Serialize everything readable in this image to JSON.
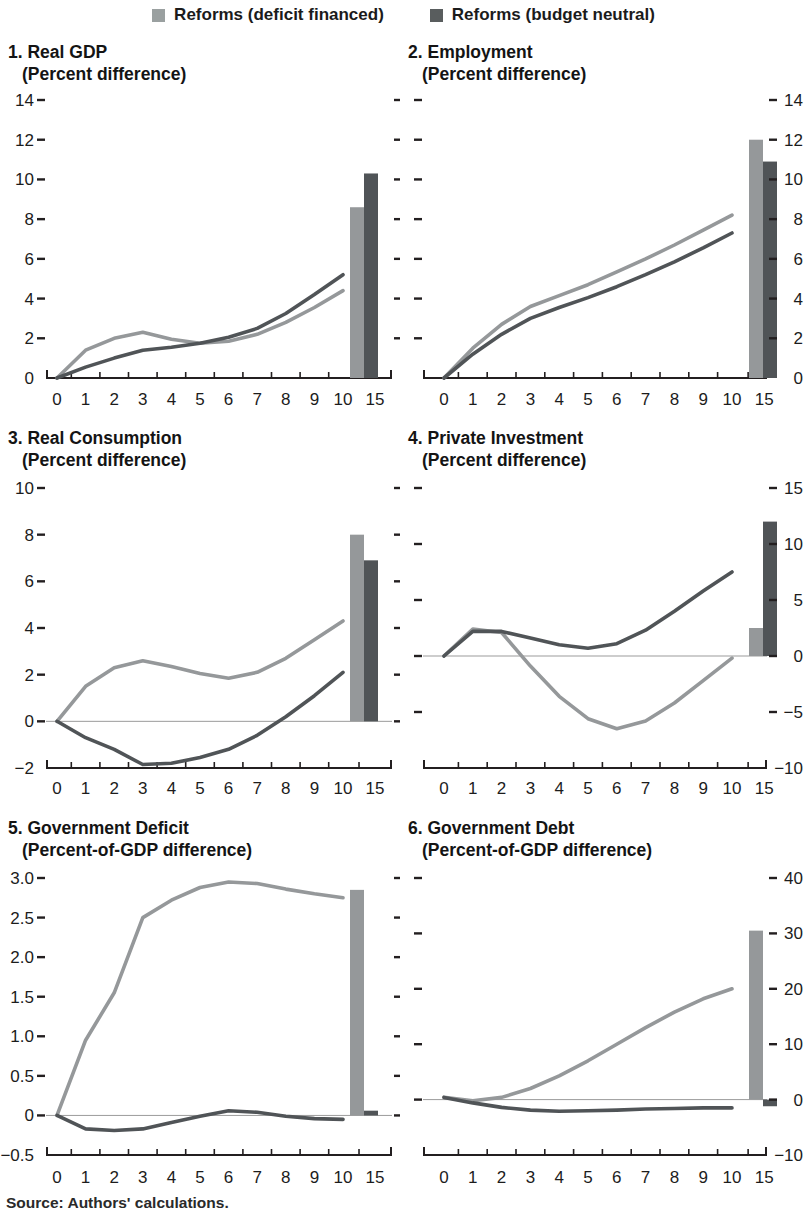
{
  "legend": {
    "items": [
      {
        "label": "Reforms (deficit financed)",
        "color": "#9aa0a0"
      },
      {
        "label": "Reforms (budget neutral)",
        "color": "#595d5e"
      }
    ]
  },
  "source_note": "Source: Authors' calculations.",
  "colors": {
    "series_light": "#95989a",
    "series_dark": "#505457",
    "axis": "#231f20",
    "tick_label": "#1c1c1c",
    "zero_line": "#9b9b9b",
    "background": "#ffffff"
  },
  "chart_data": [
    {
      "type": "line+bar",
      "title": "1. Real GDP",
      "subtitle": "(Percent difference)",
      "x": [
        0,
        1,
        2,
        3,
        4,
        5,
        6,
        7,
        8,
        9,
        10
      ],
      "x_tick_labels": [
        "0",
        "1",
        "2",
        "3",
        "4",
        "5",
        "6",
        "7",
        "8",
        "9",
        "10",
        "15"
      ],
      "bar_x_label": "15",
      "ylim": [
        0,
        14
      ],
      "yticks": [
        0,
        2,
        4,
        6,
        8,
        10,
        12,
        14
      ],
      "ytick_labels": [
        "0",
        "2",
        "4",
        "6",
        "8",
        "10",
        "12",
        "14"
      ],
      "ylabel_side": "left",
      "zero_line": false,
      "series": [
        {
          "name": "Reforms (deficit financed)",
          "values": [
            0,
            1.4,
            2.0,
            2.3,
            1.95,
            1.75,
            1.85,
            2.2,
            2.8,
            3.55,
            4.4
          ],
          "value_year15": 8.6
        },
        {
          "name": "Reforms (budget neutral)",
          "values": [
            0,
            0.55,
            1.0,
            1.4,
            1.55,
            1.75,
            2.05,
            2.5,
            3.25,
            4.2,
            5.2
          ],
          "value_year15": 10.3
        }
      ]
    },
    {
      "type": "line+bar",
      "title": "2. Employment",
      "subtitle": "(Percent difference)",
      "x": [
        0,
        1,
        2,
        3,
        4,
        5,
        6,
        7,
        8,
        9,
        10
      ],
      "x_tick_labels": [
        "0",
        "1",
        "2",
        "3",
        "4",
        "5",
        "6",
        "7",
        "8",
        "9",
        "10",
        "15"
      ],
      "bar_x_label": "15",
      "ylim": [
        0,
        14
      ],
      "yticks": [
        0,
        2,
        4,
        6,
        8,
        10,
        12,
        14
      ],
      "ytick_labels": [
        "0",
        "2",
        "4",
        "6",
        "8",
        "10",
        "12",
        "14"
      ],
      "ylabel_side": "right",
      "zero_line": false,
      "series": [
        {
          "name": "Reforms (deficit financed)",
          "values": [
            0,
            1.5,
            2.7,
            3.6,
            4.15,
            4.7,
            5.35,
            6.0,
            6.7,
            7.45,
            8.2
          ],
          "value_year15": 12.0
        },
        {
          "name": "Reforms (budget neutral)",
          "values": [
            0,
            1.2,
            2.2,
            3.0,
            3.55,
            4.05,
            4.6,
            5.2,
            5.85,
            6.55,
            7.3
          ],
          "value_year15": 10.9
        }
      ]
    },
    {
      "type": "line+bar",
      "title": "3. Real Consumption",
      "subtitle": "(Percent difference)",
      "x": [
        0,
        1,
        2,
        3,
        4,
        5,
        6,
        7,
        8,
        9,
        10
      ],
      "x_tick_labels": [
        "0",
        "1",
        "2",
        "3",
        "4",
        "5",
        "6",
        "7",
        "8",
        "9",
        "10",
        "15"
      ],
      "bar_x_label": "15",
      "ylim": [
        -2,
        10
      ],
      "yticks": [
        -2,
        0,
        2,
        4,
        6,
        8,
        10
      ],
      "ytick_labels": [
        "−2",
        "0",
        "2",
        "4",
        "6",
        "8",
        "10"
      ],
      "ylabel_side": "left",
      "zero_line": true,
      "series": [
        {
          "name": "Reforms (deficit financed)",
          "values": [
            0,
            1.5,
            2.3,
            2.6,
            2.35,
            2.05,
            1.85,
            2.1,
            2.7,
            3.5,
            4.3
          ],
          "value_year15": 8.0
        },
        {
          "name": "Reforms (budget neutral)",
          "values": [
            0,
            -0.7,
            -1.2,
            -1.85,
            -1.8,
            -1.55,
            -1.2,
            -0.6,
            0.2,
            1.1,
            2.1
          ],
          "value_year15": 6.9
        }
      ]
    },
    {
      "type": "line+bar",
      "title": "4. Private Investment",
      "subtitle": "(Percent difference)",
      "x": [
        0,
        1,
        2,
        3,
        4,
        5,
        6,
        7,
        8,
        9,
        10
      ],
      "x_tick_labels": [
        "0",
        "1",
        "2",
        "3",
        "4",
        "5",
        "6",
        "7",
        "8",
        "9",
        "10",
        "15"
      ],
      "bar_x_label": "15",
      "ylim": [
        -10,
        15
      ],
      "yticks": [
        -10,
        -5,
        0,
        5,
        10,
        15
      ],
      "ytick_labels": [
        "−10",
        "−5",
        "0",
        "5",
        "10",
        "15"
      ],
      "ylabel_side": "right",
      "zero_line": true,
      "series": [
        {
          "name": "Reforms (deficit financed)",
          "values": [
            0,
            2.4,
            2.1,
            -0.9,
            -3.6,
            -5.6,
            -6.5,
            -5.8,
            -4.2,
            -2.2,
            -0.2
          ],
          "value_year15": 2.5
        },
        {
          "name": "Reforms (budget neutral)",
          "values": [
            0,
            2.2,
            2.2,
            1.6,
            1.0,
            0.7,
            1.1,
            2.3,
            4.0,
            5.8,
            7.5
          ],
          "value_year15": 12.0
        }
      ]
    },
    {
      "type": "line+bar",
      "title": "5. Government Deficit",
      "subtitle": "(Percent-of-GDP difference)",
      "x": [
        0,
        1,
        2,
        3,
        4,
        5,
        6,
        7,
        8,
        9,
        10
      ],
      "x_tick_labels": [
        "0",
        "1",
        "2",
        "3",
        "4",
        "5",
        "6",
        "7",
        "8",
        "9",
        "10",
        "15"
      ],
      "bar_x_label": "15",
      "ylim": [
        -0.5,
        3.0
      ],
      "yticks": [
        -0.5,
        0,
        0.5,
        1.0,
        1.5,
        2.0,
        2.5,
        3.0
      ],
      "ytick_labels": [
        "−0.5",
        "0",
        "0.5",
        "1.0",
        "1.5",
        "2.0",
        "2.5",
        "3.0"
      ],
      "ylabel_side": "left",
      "zero_line": true,
      "series": [
        {
          "name": "Reforms (deficit financed)",
          "values": [
            0,
            0.95,
            1.55,
            2.5,
            2.72,
            2.88,
            2.95,
            2.93,
            2.86,
            2.8,
            2.75
          ],
          "value_year15": 2.85
        },
        {
          "name": "Reforms (budget neutral)",
          "values": [
            0,
            -0.17,
            -0.19,
            -0.17,
            -0.09,
            -0.01,
            0.06,
            0.04,
            -0.01,
            -0.04,
            -0.05
          ],
          "value_year15": 0.06
        }
      ]
    },
    {
      "type": "line+bar",
      "title": "6. Government Debt",
      "subtitle": "(Percent-of-GDP difference)",
      "x": [
        0,
        1,
        2,
        3,
        4,
        5,
        6,
        7,
        8,
        9,
        10
      ],
      "x_tick_labels": [
        "0",
        "1",
        "2",
        "3",
        "4",
        "5",
        "6",
        "7",
        "8",
        "9",
        "10",
        "15"
      ],
      "bar_x_label": "15",
      "ylim": [
        -10,
        40
      ],
      "yticks": [
        -10,
        0,
        10,
        20,
        30,
        40
      ],
      "ytick_labels": [
        "−10",
        "0",
        "10",
        "20",
        "30",
        "40"
      ],
      "ylabel_side": "right",
      "zero_line": true,
      "series": [
        {
          "name": "Reforms (deficit financed)",
          "values": [
            0.4,
            -0.2,
            0.4,
            2.0,
            4.3,
            7.0,
            10.0,
            13.0,
            15.8,
            18.2,
            20.0
          ],
          "value_year15": 30.5
        },
        {
          "name": "Reforms (budget neutral)",
          "values": [
            0.4,
            -0.6,
            -1.4,
            -1.9,
            -2.1,
            -2.0,
            -1.9,
            -1.7,
            -1.6,
            -1.5,
            -1.5
          ],
          "value_year15": -1.2
        }
      ]
    }
  ]
}
